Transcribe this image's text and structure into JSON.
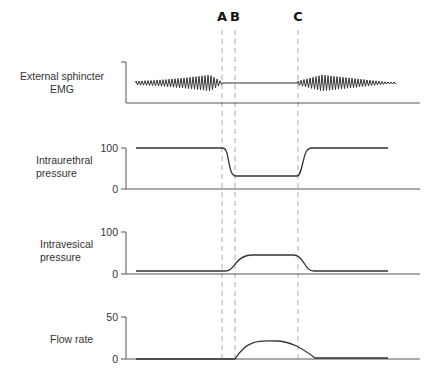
{
  "markers": [
    {
      "label": "A",
      "x": 222
    },
    {
      "label": "B",
      "x": 235
    },
    {
      "label": "C",
      "x": 298
    }
  ],
  "panels": [
    {
      "id": "emg",
      "label_line1": "External sphincter",
      "label_line2": "EMG",
      "ticks": []
    },
    {
      "id": "urethral",
      "label_line1": "Intraurethral",
      "label_line2": "pressure",
      "ticks": [
        "100",
        "0"
      ]
    },
    {
      "id": "vesical",
      "label_line1": "Intravesical",
      "label_line2": "pressure",
      "ticks": [
        "100",
        "0"
      ]
    },
    {
      "id": "flow",
      "label_line1": "Flow rate",
      "label_line2": "",
      "ticks": [
        "50",
        "0"
      ]
    }
  ],
  "chart_data": [
    {
      "type": "line",
      "title": "External sphincter EMG",
      "ylabel": "External sphincter EMG",
      "description": "High-amplitude oscillatory EMG activity before A, silent (flat line) from A to C, activity resumes after C and tapers off",
      "x": [
        "start",
        "A",
        "B",
        "C",
        "end"
      ],
      "values": [
        "active",
        "silent",
        "silent",
        "active",
        "tapering"
      ]
    },
    {
      "type": "line",
      "title": "Intraurethral pressure",
      "ylabel": "Intraurethral pressure",
      "ylim": [
        0,
        100
      ],
      "x": [
        "start",
        "A",
        "B",
        "C",
        "C+",
        "end"
      ],
      "values": [
        100,
        100,
        32,
        32,
        100,
        100
      ]
    },
    {
      "type": "line",
      "title": "Intravesical pressure",
      "ylabel": "Intravesical pressure",
      "ylim": [
        0,
        100
      ],
      "x": [
        "start",
        "A",
        "B",
        "mid",
        "C",
        "C+",
        "end"
      ],
      "values": [
        8,
        8,
        40,
        45,
        44,
        8,
        8
      ]
    },
    {
      "type": "line",
      "title": "Flow rate",
      "ylabel": "Flow rate",
      "ylim": [
        0,
        50
      ],
      "x": [
        "start",
        "A",
        "B",
        "mid",
        "C",
        "C+",
        "end"
      ],
      "values": [
        0,
        0,
        0,
        21,
        14,
        0,
        0
      ]
    }
  ]
}
